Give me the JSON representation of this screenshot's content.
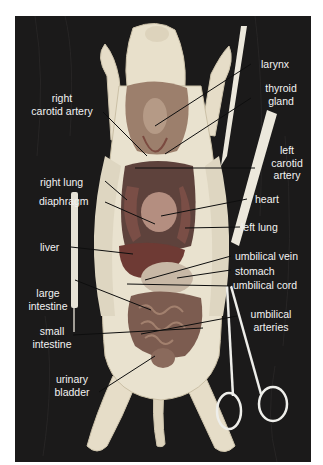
{
  "figure": {
    "labels": {
      "larynx": "larynx",
      "thyroid_gland_1": "thyroid",
      "thyroid_gland_2": "gland",
      "right_carotid_1": "right",
      "right_carotid_2": "carotid artery",
      "left_carotid_1": "left",
      "left_carotid_2": "carotid",
      "left_carotid_3": "artery",
      "right_lung": "right lung",
      "diaphragm": "diaphragm",
      "heart": "heart",
      "left_lung": "left lung",
      "liver": "liver",
      "umbilical_vein": "umbilical vein",
      "stomach": "stomach",
      "umbilical_cord": "umbilical cord",
      "large_intestine_1": "large",
      "large_intestine_2": "intestine",
      "umbilical_arteries_1": "umbilical",
      "umbilical_arteries_2": "arteries",
      "small_intestine_1": "small",
      "small_intestine_2": "intestine",
      "urinary_bladder_1": "urinary",
      "urinary_bladder_2": "bladder"
    },
    "colors": {
      "background": "#1b1a1a",
      "skin": "#e9e2cf",
      "tissue": "#a98f7a",
      "organ_dark": "#5a3a36",
      "liver": "#6e3a34",
      "label_text": "#f2f2f2",
      "leader_line": "#111111"
    }
  }
}
